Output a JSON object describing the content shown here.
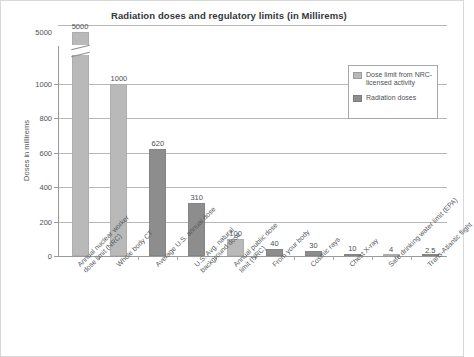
{
  "chart_data": {
    "type": "bar",
    "title": "Radiation doses and regulatory limits (in Millirems)",
    "xlabel": "",
    "ylabel": "Doses in millirems",
    "ylim": [
      0,
      5000
    ],
    "y_axis_broken": true,
    "grid": true,
    "ticks": [
      "0",
      "200",
      "400",
      "600",
      "800",
      "1000",
      "5000"
    ],
    "legend_position": "top-right",
    "legend": [
      {
        "key": "limit",
        "label": "Dose limit\nfrom NRC-licensed\nactivity",
        "color": "#b9b9b9"
      },
      {
        "key": "dose",
        "label": "Radiation doses",
        "color": "#8d8d8d"
      }
    ],
    "categories": [
      "Annual nuclear worker dose limit (NRC)",
      "Whole body CT",
      "Average U.S. annual dose",
      "U.S. Avg. natural background dose",
      "Annual public dose limit (NRC)",
      "From your body",
      "Cosmic rays",
      "Chest X-ray",
      "Safe drinking water limit (EPA)",
      "Trans-Atlantic flight"
    ],
    "values": [
      5000,
      1000,
      620,
      310,
      100,
      40,
      30,
      10,
      4,
      2.5
    ],
    "value_labels": [
      "5000",
      "1000",
      "620",
      "310",
      "100",
      "40",
      "30",
      "10",
      "4",
      "2.5"
    ],
    "series_of_bar": [
      "limit",
      "limit",
      "dose",
      "dose",
      "limit",
      "dose",
      "dose",
      "dose",
      "limit",
      "dose"
    ]
  },
  "axis": {
    "y_label": "Doses in millirems",
    "y_ticks": [
      {
        "label": "5000",
        "value": 5000
      },
      {
        "label": "1000",
        "value": 1000
      },
      {
        "label": "800",
        "value": 800
      },
      {
        "label": "600",
        "value": 600
      },
      {
        "label": "400",
        "value": 400
      },
      {
        "label": "200",
        "value": 200
      },
      {
        "label": "0",
        "value": 0
      }
    ]
  },
  "legend": {
    "item1_line1": "Dose limit",
    "item1_line2": "from NRC-licensed",
    "item1_line3": "activity",
    "item2_line1": "Radiation doses"
  },
  "categories": [
    {
      "l1": "Annual nuclear worker",
      "l2": "dose limit (NRC)"
    },
    {
      "l1": "Whole body CT",
      "l2": ""
    },
    {
      "l1": "Average U.S. annual dose",
      "l2": ""
    },
    {
      "l1": "U.S. Avg. natural",
      "l2": "background dose"
    },
    {
      "l1": "Annual public dose",
      "l2": "limit (NRC)"
    },
    {
      "l1": "From your body",
      "l2": ""
    },
    {
      "l1": "Cosmic rays",
      "l2": ""
    },
    {
      "l1": "Chest X-ray",
      "l2": ""
    },
    {
      "l1": "Safe drinking water limit (EPA)",
      "l2": ""
    },
    {
      "l1": "Trans-Atlantic flight",
      "l2": ""
    }
  ],
  "values": {
    "v0": "5000",
    "v1": "1000",
    "v2": "620",
    "v3": "310",
    "v4": "100",
    "v5": "40",
    "v6": "30",
    "v7": "10",
    "v8": "4",
    "v9": "2.5"
  }
}
